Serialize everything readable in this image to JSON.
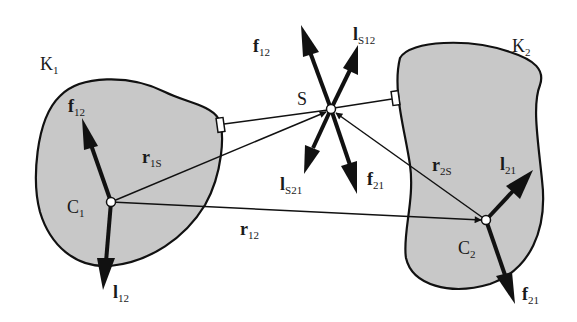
{
  "colors": {
    "body_fill": "#c8c8c8",
    "stroke": "#111111",
    "background": "#ffffff",
    "node_fill": "#ffffff"
  },
  "bodies": [
    {
      "id": "K1",
      "label": "K",
      "sub": "1"
    },
    {
      "id": "K2",
      "label": "K",
      "sub": "2"
    }
  ],
  "points": [
    {
      "id": "C1",
      "label": "C",
      "sub": "1"
    },
    {
      "id": "C2",
      "label": "C",
      "sub": "2"
    },
    {
      "id": "S",
      "label": "S",
      "sub": ""
    }
  ],
  "vectors": {
    "f12_C1": {
      "label": "f",
      "sub": "12"
    },
    "l12_C1": {
      "label": "l",
      "sub": "12"
    },
    "l21_C2": {
      "label": "l",
      "sub": "21"
    },
    "f21_C2": {
      "label": "f",
      "sub": "21"
    },
    "f12_S": {
      "label": "f",
      "sub": "12"
    },
    "lS12_S": {
      "label": "l",
      "sub": "S12"
    },
    "lS21_S": {
      "label": "l",
      "sub": "S21"
    },
    "f21_S": {
      "label": "f",
      "sub": "21"
    },
    "r1S": {
      "label": "r",
      "sub": "1S"
    },
    "r2S": {
      "label": "r",
      "sub": "2S"
    },
    "r12": {
      "label": "r",
      "sub": "12"
    }
  }
}
